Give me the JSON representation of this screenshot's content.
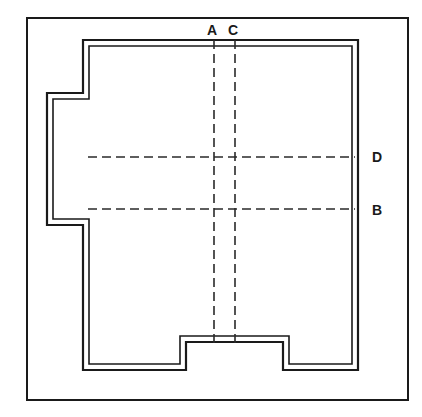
{
  "diagram": {
    "type": "architectural-floor-plan",
    "canvas": {
      "width": 422,
      "height": 417
    },
    "colors": {
      "background": "#ffffff",
      "line": "#1a1a1a",
      "wall_fill": "#ffffff",
      "dashed_line": "#2a2a2a"
    },
    "outer_frame": {
      "name": "outer-border",
      "x": 27,
      "y": 18,
      "width": 381,
      "height": 382,
      "stroke_width": 2
    },
    "wall_outline": {
      "name": "building-wall-outline",
      "description": "Double-line wall drawn as an outer polygon and an inner polygon offset inward by the wall thickness.",
      "wall_thickness": 6,
      "outer_points": "83,40 358,40 358,370 283,370 283,342 186,342 186,370 83,370 83,225 47,225 47,93 83,93 83,40",
      "inner_points": "89,46 352,46 352,364 289,364 289,336 180,336 180,364 89,364 89,219 53,219 53,99 89,99 89,46"
    },
    "notches": [
      {
        "name": "left-bump-out",
        "side": "left",
        "x_from": 47,
        "x_to": 83,
        "y_from": 93,
        "y_to": 225
      },
      {
        "name": "bottom-recess",
        "side": "bottom",
        "x_from": 186,
        "x_to": 283,
        "y_from": 342,
        "y_to": 370
      }
    ],
    "section_lines": [
      {
        "id": "A",
        "label": "A",
        "orientation": "vertical",
        "position": 214,
        "from": 40,
        "to": 348,
        "label_x": 207,
        "label_y": 23
      },
      {
        "id": "C",
        "label": "C",
        "orientation": "vertical",
        "position": 235,
        "from": 40,
        "to": 348,
        "label_x": 228,
        "label_y": 23
      },
      {
        "id": "D",
        "label": "D",
        "orientation": "horizontal",
        "position": 157,
        "from": 88,
        "to": 355,
        "label_x": 372,
        "label_y": 150
      },
      {
        "id": "B",
        "label": "B",
        "orientation": "horizontal",
        "position": 209,
        "from": 88,
        "to": 355,
        "label_x": 372,
        "label_y": 203
      }
    ],
    "dash_pattern": "9,5"
  }
}
